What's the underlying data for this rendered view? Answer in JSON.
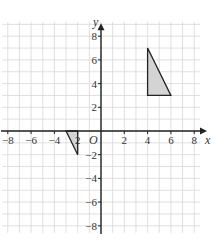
{
  "chart_data": {
    "type": "coordinate-grid",
    "title": "",
    "xlabel": "x",
    "ylabel": "y",
    "origin_label": "O",
    "xlim": [
      -8,
      8
    ],
    "ylim": [
      -8,
      8
    ],
    "grid": true,
    "grid_step": 1,
    "x_ticks": [
      -8,
      -6,
      -4,
      -2,
      2,
      4,
      6,
      8
    ],
    "y_ticks": [
      8,
      6,
      4,
      2,
      -2,
      -4,
      -6,
      -8
    ],
    "x_tick_labels": [
      "−8",
      "−6",
      "−4",
      "2",
      "2",
      "4",
      "6",
      "8"
    ],
    "y_tick_labels": [
      "8",
      "6",
      "4",
      "2",
      "−2",
      "−4",
      "−6",
      "−8"
    ],
    "shapes": [
      {
        "name": "triangle-a",
        "vertices": [
          [
            4,
            7
          ],
          [
            4,
            3
          ],
          [
            6,
            3
          ]
        ],
        "fill": "#d4d4d4",
        "stroke": "#222222"
      },
      {
        "name": "triangle-b",
        "vertices": [
          [
            -3,
            0
          ],
          [
            -2,
            0
          ],
          [
            -2,
            -2
          ]
        ],
        "fill": "#d4d4d4",
        "stroke": "#222222"
      }
    ],
    "colors": {
      "grid": "#d8d8d8",
      "axis": "#222222"
    }
  }
}
